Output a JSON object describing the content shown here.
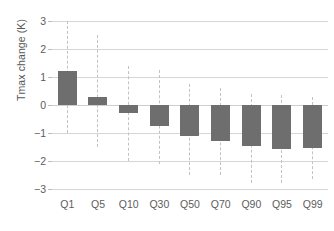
{
  "chart_data": {
    "type": "bar",
    "title": "",
    "xlabel": "",
    "ylabel": "Tmax change (K)",
    "categories": [
      "Q1",
      "Q5",
      "Q10",
      "Q30",
      "Q50",
      "Q70",
      "Q90",
      "Q95",
      "Q99"
    ],
    "values": [
      1.22,
      0.28,
      -0.3,
      -0.75,
      -1.1,
      -1.28,
      -1.47,
      -1.57,
      -1.53
    ],
    "error_ranges": [
      {
        "category": "Q1",
        "low": -1.0,
        "high": 3.0
      },
      {
        "category": "Q5",
        "low": -1.5,
        "high": 2.5
      },
      {
        "category": "Q10",
        "low": -2.0,
        "high": 1.4
      },
      {
        "category": "Q30",
        "low": -2.1,
        "high": 1.25
      },
      {
        "category": "Q50",
        "low": -2.5,
        "high": 0.75
      },
      {
        "category": "Q70",
        "low": -2.5,
        "high": 0.6
      },
      {
        "category": "Q90",
        "low": -2.8,
        "high": 0.4
      },
      {
        "category": "Q95",
        "low": -2.8,
        "high": 0.35
      },
      {
        "category": "Q99",
        "low": -2.65,
        "high": 0.3
      }
    ],
    "ylim": [
      -3,
      3
    ],
    "yticks": [
      3,
      2,
      1,
      0,
      -1,
      -2,
      -3
    ],
    "ytick_labels": [
      "3",
      "2",
      "1",
      "0",
      "−1",
      "−2",
      "−3"
    ],
    "grid": true,
    "legend": "none",
    "bar_color": "#6e6e6e",
    "whisker_color": "#c2c2c2",
    "grid_color": "#d6d6d6",
    "background_color": "#ffffff"
  }
}
